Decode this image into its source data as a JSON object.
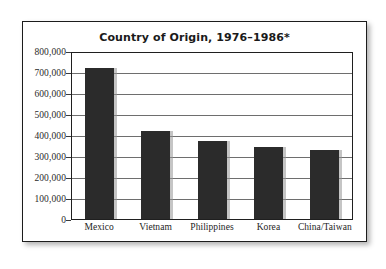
{
  "chart_data": {
    "type": "bar",
    "title": "Country of Origin, 1976–1986*",
    "xlabel": "",
    "ylabel": "",
    "categories": [
      "Mexico",
      "Vietnam",
      "Philippines",
      "Korea",
      "China/Taiwan"
    ],
    "values": [
      725000,
      425000,
      375000,
      350000,
      335000
    ],
    "ylim": [
      0,
      800000
    ],
    "ytick_values": [
      0,
      100000,
      200000,
      300000,
      400000,
      500000,
      600000,
      700000,
      800000
    ],
    "ytick_labels": [
      "0",
      "100,000",
      "200,000",
      "300,000",
      "400,000",
      "500,000",
      "600,000",
      "700,000",
      "800,000"
    ],
    "grid": true,
    "legend": false,
    "bar_color": "#2b2b2b",
    "gridline_color": "#6e6e6e",
    "axis_color": "#1f1f1f",
    "background_color": "#ffffff"
  }
}
